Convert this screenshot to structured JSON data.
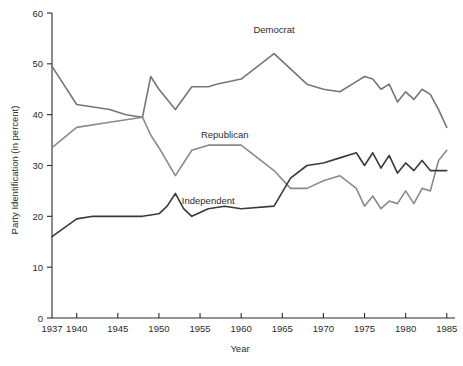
{
  "chart_data": {
    "type": "line",
    "title": "",
    "xlabel": "Year",
    "ylabel": "Party Identification (in percent)",
    "xlim": [
      1937,
      1986
    ],
    "ylim": [
      0,
      60
    ],
    "grid": false,
    "legend": "inline-labels",
    "x_ticks": [
      "1937",
      "1940",
      "1945",
      "1950",
      "1955",
      "1960",
      "1965",
      "1970",
      "1975",
      "1980",
      "1985"
    ],
    "x_tick_values": [
      1937,
      1940,
      1945,
      1950,
      1955,
      1960,
      1965,
      1970,
      1975,
      1980,
      1985
    ],
    "y_ticks": [
      "0",
      "10",
      "20",
      "30",
      "40",
      "50",
      "60"
    ],
    "y_tick_values": [
      0,
      10,
      20,
      30,
      40,
      50,
      60
    ],
    "series": [
      {
        "name": "Democrat",
        "color": "#767676",
        "label_x": 1964,
        "label_y": 56,
        "x": [
          1937,
          1940,
          1944,
          1946,
          1948,
          1949,
          1950,
          1952,
          1954,
          1956,
          1957,
          1960,
          1964,
          1966,
          1968,
          1970,
          1972,
          1974,
          1975,
          1976,
          1977,
          1978,
          1979,
          1980,
          1981,
          1982,
          1983,
          1984,
          1985
        ],
        "values": [
          49.5,
          42.0,
          41.0,
          40.0,
          39.5,
          47.5,
          45.0,
          41.0,
          45.5,
          45.5,
          46.0,
          47.0,
          52.0,
          49.0,
          46.0,
          45.0,
          44.5,
          46.5,
          47.5,
          47.0,
          45.0,
          46.0,
          42.5,
          44.5,
          43.0,
          45.0,
          44.0,
          41.0,
          37.5
        ]
      },
      {
        "name": "Republican",
        "color": "#8a8a8a",
        "label_x": 1958,
        "label_y": 35.5,
        "x": [
          1937,
          1940,
          1944,
          1946,
          1948,
          1949,
          1950,
          1952,
          1954,
          1956,
          1960,
          1964,
          1966,
          1968,
          1970,
          1972,
          1974,
          1975,
          1976,
          1977,
          1978,
          1979,
          1980,
          1981,
          1982,
          1983,
          1984,
          1985
        ],
        "values": [
          33.5,
          37.5,
          38.5,
          39.0,
          39.5,
          36.0,
          33.5,
          28.0,
          33.0,
          34.0,
          34.0,
          29.0,
          25.5,
          25.5,
          27.0,
          28.0,
          25.5,
          22.0,
          24.0,
          21.5,
          23.0,
          22.5,
          25.0,
          22.5,
          25.5,
          25.0,
          31.0,
          33.0
        ]
      },
      {
        "name": "Independent",
        "color": "#3a3a3a",
        "label_x": 1956,
        "label_y": 22.5,
        "x": [
          1937,
          1940,
          1942,
          1944,
          1946,
          1948,
          1950,
          1951,
          1952,
          1953,
          1954,
          1956,
          1958,
          1960,
          1964,
          1966,
          1968,
          1970,
          1972,
          1974,
          1975,
          1976,
          1977,
          1978,
          1979,
          1980,
          1981,
          1982,
          1983,
          1984,
          1985
        ],
        "values": [
          16.0,
          19.5,
          20.0,
          20.0,
          20.0,
          20.0,
          20.5,
          22.0,
          24.5,
          21.5,
          20.0,
          21.5,
          22.0,
          21.5,
          22.0,
          27.5,
          30.0,
          30.5,
          31.5,
          32.5,
          30.0,
          32.5,
          29.5,
          32.0,
          28.5,
          30.5,
          29.0,
          31.0,
          29.0,
          29.0,
          29.0
        ]
      }
    ]
  }
}
